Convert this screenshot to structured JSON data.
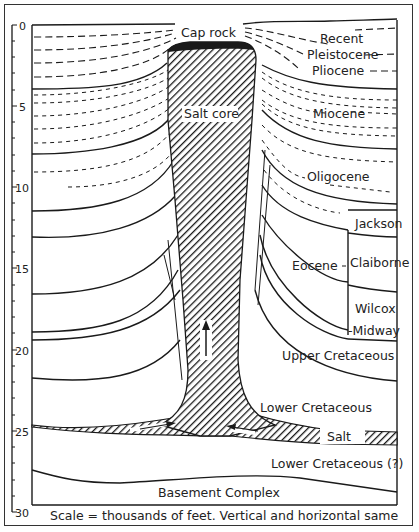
{
  "diagram": {
    "type": "geologic-cross-section",
    "scale": {
      "ticks": [
        "0",
        "5",
        "10",
        "15",
        "20",
        "25",
        "30"
      ],
      "caption": "Scale = thousands of feet. Vertical and horizontal same"
    },
    "labels": {
      "cap_rock": "Cap rock",
      "salt_core": "Salt core",
      "salt": "Salt",
      "recent": "Recent",
      "pleistocene": "Pleistocene",
      "pliocene": "Pliocene",
      "miocene": "Miocene",
      "oligocene": "Oligocene",
      "eocene": "Eocene",
      "jackson": "Jackson",
      "claiborne": "Claiborne",
      "wilcox": "Wilcox",
      "midway": "-Midway",
      "upper_cretaceous": "Upper Cretaceous",
      "lower_cretaceous": "Lower Cretaceous",
      "lower_cretaceous_q": "Lower Cretaceous (?)",
      "basement": "Basement Complex"
    },
    "colors": {
      "ink": "#1a1a1a",
      "paper": "#ffffff"
    }
  }
}
